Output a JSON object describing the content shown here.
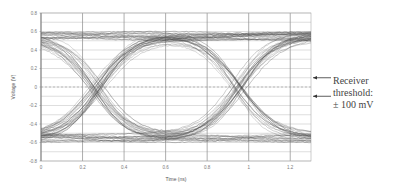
{
  "chart_data": {
    "type": "line",
    "subtype": "eye-diagram",
    "title": "",
    "xlabel": "Time (ns)",
    "ylabel": "Voltage (V)",
    "xlim": [
      0,
      1.3
    ],
    "ylim": [
      -0.8,
      0.8
    ],
    "xticks": [
      "0",
      "0.2",
      "0.4",
      "0.6",
      "0.8",
      "1",
      "1.2"
    ],
    "yticks": [
      "0.8",
      "0.6",
      "0.4",
      "0.2",
      "0",
      "-0.2",
      "-0.4",
      "-0.6",
      "-0.8"
    ],
    "grid": true,
    "minor_y_grid_step": 0.1,
    "high_level_v": [
      0.5,
      0.6
    ],
    "low_level_v": [
      -0.6,
      -0.5
    ],
    "crossing_times_ns": [
      0.27,
      0.95
    ],
    "threshold_lines_v": [
      0.1,
      0,
      -0.1
    ],
    "annotation": {
      "lines": [
        "Receiver",
        "threshold:",
        "± 100 mV"
      ]
    }
  }
}
